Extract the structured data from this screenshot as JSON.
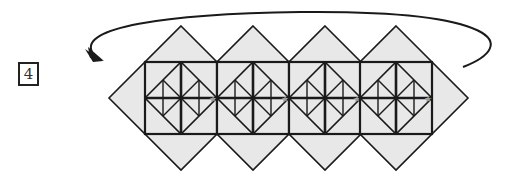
{
  "figure": {
    "step_number": "4",
    "module_count": 4,
    "module_centers_x": [
      181,
      253,
      325,
      396
    ],
    "center_y": 98,
    "colors": {
      "fill": "#e8e8e8",
      "line": "#1a1a1a",
      "star": "#9a9a9a"
    },
    "arrow": {
      "description": "curved arrow wrapping from right end back over the top to left end"
    }
  }
}
